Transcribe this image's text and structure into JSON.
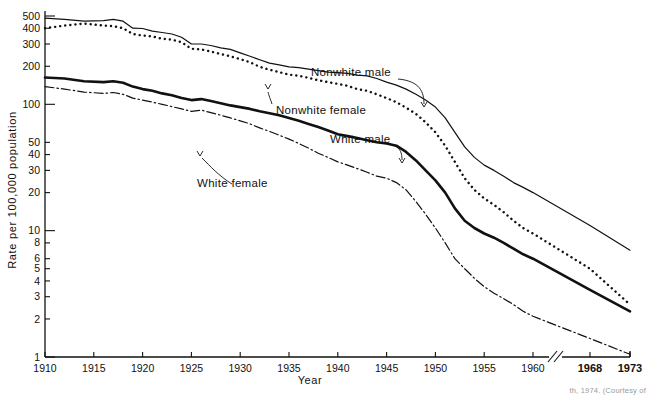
{
  "chart_data": {
    "type": "line",
    "title": "",
    "xlabel": "Year",
    "ylabel": "Rate per 100,000 population",
    "yscale": "log",
    "ylim": [
      1,
      600
    ],
    "grid": false,
    "legend": "inline-annotations",
    "axis_break": {
      "present": true,
      "between": [
        1962,
        1965
      ],
      "note": "scale break between 1960 and 1968"
    },
    "ytick_labels": [
      "1",
      "2",
      "3",
      "4",
      "5",
      "6",
      "8",
      "10",
      "20",
      "30",
      "40",
      "50",
      "100",
      "200",
      "300",
      "400",
      "500"
    ],
    "ytick_values": [
      1,
      2,
      3,
      4,
      5,
      6,
      8,
      10,
      20,
      30,
      40,
      50,
      100,
      200,
      300,
      400,
      500
    ],
    "xtick_labels": [
      "1910",
      "1915",
      "1920",
      "1925",
      "1930",
      "1935",
      "1940",
      "1945",
      "1950",
      "1955",
      "1960",
      "1968",
      "1973"
    ],
    "xtick_values": [
      1910,
      1915,
      1920,
      1925,
      1930,
      1935,
      1940,
      1945,
      1950,
      1955,
      1960,
      1968,
      1973
    ],
    "series": [
      {
        "name": "Nonwhite male",
        "style": "thin-solid",
        "color": "#111111",
        "x": [
          1910,
          1912,
          1914,
          1916,
          1917,
          1918,
          1919,
          1920,
          1921,
          1922,
          1923,
          1924,
          1925,
          1926,
          1927,
          1928,
          1929,
          1930,
          1931,
          1932,
          1933,
          1934,
          1935,
          1936,
          1937,
          1938,
          1939,
          1940,
          1941,
          1942,
          1943,
          1944,
          1945,
          1946,
          1947,
          1948,
          1949,
          1950,
          1951,
          1952,
          1953,
          1954,
          1955,
          1956,
          1957,
          1958,
          1959,
          1960,
          1968,
          1973
        ],
        "y": [
          480,
          470,
          455,
          460,
          470,
          455,
          400,
          398,
          380,
          370,
          360,
          340,
          300,
          300,
          292,
          280,
          272,
          255,
          240,
          225,
          212,
          205,
          198,
          195,
          190,
          185,
          180,
          178,
          176,
          170,
          168,
          160,
          150,
          142,
          132,
          120,
          108,
          95,
          78,
          60,
          46,
          38,
          33,
          30,
          27,
          24,
          22,
          20,
          11,
          7.0
        ]
      },
      {
        "name": "Nonwhite female",
        "style": "dotted",
        "color": "#111111",
        "x": [
          1910,
          1912,
          1914,
          1916,
          1917,
          1918,
          1919,
          1920,
          1921,
          1922,
          1923,
          1924,
          1925,
          1926,
          1927,
          1928,
          1929,
          1930,
          1931,
          1932,
          1933,
          1934,
          1935,
          1936,
          1937,
          1938,
          1939,
          1940,
          1941,
          1942,
          1943,
          1944,
          1945,
          1946,
          1947,
          1948,
          1949,
          1950,
          1951,
          1952,
          1953,
          1954,
          1955,
          1956,
          1957,
          1958,
          1959,
          1960,
          1968,
          1973
        ],
        "y": [
          400,
          420,
          435,
          420,
          415,
          400,
          360,
          350,
          345,
          330,
          325,
          310,
          275,
          272,
          262,
          250,
          240,
          228,
          215,
          198,
          188,
          180,
          172,
          168,
          162,
          155,
          150,
          145,
          140,
          132,
          128,
          120,
          112,
          104,
          94,
          84,
          72,
          60,
          47,
          35,
          26,
          21,
          18,
          16,
          14,
          12,
          10.5,
          9.5,
          5.0,
          2.6
        ]
      },
      {
        "name": "White male",
        "style": "thick-solid",
        "color": "#111111",
        "x": [
          1910,
          1912,
          1914,
          1916,
          1917,
          1918,
          1919,
          1920,
          1921,
          1922,
          1923,
          1924,
          1925,
          1926,
          1927,
          1928,
          1929,
          1930,
          1931,
          1932,
          1933,
          1934,
          1935,
          1936,
          1937,
          1938,
          1939,
          1940,
          1941,
          1942,
          1943,
          1944,
          1945,
          1946,
          1947,
          1948,
          1949,
          1950,
          1951,
          1952,
          1953,
          1954,
          1955,
          1956,
          1957,
          1958,
          1959,
          1960,
          1968,
          1973
        ],
        "y": [
          163,
          160,
          152,
          150,
          152,
          148,
          138,
          132,
          128,
          122,
          118,
          112,
          108,
          110,
          106,
          102,
          98,
          95,
          92,
          88,
          85,
          82,
          78,
          74,
          70,
          66,
          62,
          58,
          56,
          54,
          52,
          50,
          49,
          47,
          42,
          36,
          30,
          25,
          20,
          15,
          12,
          10.5,
          9.5,
          8.8,
          8.0,
          7.2,
          6.5,
          6.0,
          3.4,
          2.3
        ]
      },
      {
        "name": "White female",
        "style": "dash-dot",
        "color": "#111111",
        "x": [
          1910,
          1912,
          1914,
          1916,
          1917,
          1918,
          1919,
          1920,
          1921,
          1922,
          1923,
          1924,
          1925,
          1926,
          1927,
          1928,
          1929,
          1930,
          1931,
          1932,
          1933,
          1934,
          1935,
          1936,
          1937,
          1938,
          1939,
          1940,
          1941,
          1942,
          1943,
          1944,
          1945,
          1946,
          1947,
          1948,
          1949,
          1950,
          1951,
          1952,
          1953,
          1954,
          1955,
          1956,
          1957,
          1958,
          1959,
          1960,
          1968,
          1973
        ],
        "y": [
          138,
          132,
          125,
          122,
          124,
          120,
          112,
          108,
          104,
          100,
          96,
          92,
          88,
          90,
          86,
          82,
          78,
          74,
          70,
          65,
          61,
          57,
          53,
          49,
          45,
          41,
          38,
          35,
          33,
          31,
          29,
          27,
          26,
          24,
          21,
          17,
          13.5,
          10.5,
          8.0,
          6.0,
          5.0,
          4.2,
          3.6,
          3.2,
          2.9,
          2.6,
          2.3,
          2.1,
          1.4,
          1.05
        ]
      }
    ],
    "annotations": [
      {
        "text": "Nonwhite male",
        "label_x": 311,
        "label_y": 76,
        "arrow": "curved-down-right"
      },
      {
        "text": "Nonwhite female",
        "label_x": 276,
        "label_y": 114,
        "arrow": "short-up-left"
      },
      {
        "text": "White male",
        "label_x": 330,
        "label_y": 143,
        "arrow": "curved-down-right"
      },
      {
        "text": "White female",
        "label_x": 197,
        "label_y": 187,
        "arrow": "curved-up-right"
      }
    ]
  },
  "caption": {
    "text": "th, 1974. (Courtesy of"
  }
}
